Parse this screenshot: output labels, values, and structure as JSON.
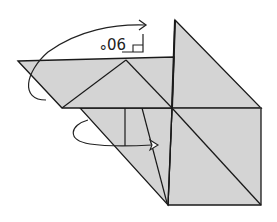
{
  "diagram": {
    "type": "origami-fold-step",
    "angle_label": "90°",
    "right_angle_marker": true,
    "colors": {
      "paper": "#d4d4d4",
      "line": "#1a1a1a",
      "background": "#ffffff"
    },
    "arrows": [
      {
        "name": "fold-up-arrow",
        "direction": "right",
        "description": "curved arrow over top fold 90 degrees"
      },
      {
        "name": "tuck-arrow",
        "direction": "right",
        "description": "curved arrow looping under lower flap"
      }
    ]
  }
}
